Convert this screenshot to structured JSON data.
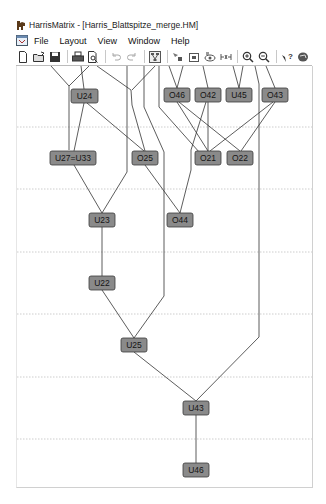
{
  "window": {
    "title": "HarrisMatrix - [Harris_Blattspitze_merge.HM]"
  },
  "menubar": {
    "items": [
      {
        "label": "File"
      },
      {
        "label": "Layout"
      },
      {
        "label": "View"
      },
      {
        "label": "Window"
      },
      {
        "label": "Help"
      }
    ]
  },
  "toolbar": {
    "buttons": [
      {
        "icon": "new-document-icon"
      },
      {
        "icon": "open-folder-icon"
      },
      {
        "icon": "save-icon"
      },
      {
        "icon": "print-icon"
      },
      {
        "icon": "print-preview-icon"
      },
      {
        "icon": "undo-icon",
        "disabled": true
      },
      {
        "icon": "redo-icon",
        "disabled": true
      },
      {
        "icon": "layout-icon"
      },
      {
        "icon": "select-node-icon"
      },
      {
        "icon": "node-properties-icon"
      },
      {
        "icon": "view-icon"
      },
      {
        "icon": "merge-icon"
      },
      {
        "icon": "zoom-in-icon"
      },
      {
        "icon": "zoom-out-icon"
      },
      {
        "icon": "help-icon"
      },
      {
        "icon": "about-icon"
      }
    ]
  },
  "matrix": {
    "node_fill": "#8a8a8a",
    "node_border": "#3a3a3a",
    "edge_color": "#333333",
    "nodes": [
      {
        "id": "U24",
        "label": "U24",
        "x": 67,
        "y": 96,
        "w": 28
      },
      {
        "id": "O46",
        "label": "O46",
        "x": 176,
        "y": 95,
        "w": 26
      },
      {
        "id": "O42",
        "label": "O42",
        "x": 207,
        "y": 95,
        "w": 26
      },
      {
        "id": "U45",
        "label": "U45",
        "x": 238,
        "y": 95,
        "w": 26
      },
      {
        "id": "O43",
        "label": "O43",
        "x": 274,
        "y": 95,
        "w": 26
      },
      {
        "id": "U27=U33",
        "label": "U27=U33",
        "x": 72,
        "y": 158,
        "w": 46
      },
      {
        "id": "O25",
        "label": "O25",
        "x": 144,
        "y": 158,
        "w": 26
      },
      {
        "id": "O21",
        "label": "O21",
        "x": 207,
        "y": 158,
        "w": 26
      },
      {
        "id": "O22",
        "label": "O22",
        "x": 239,
        "y": 158,
        "w": 26
      },
      {
        "id": "U23",
        "label": "U23",
        "x": 101,
        "y": 220,
        "w": 26
      },
      {
        "id": "O44",
        "label": "O44",
        "x": 179,
        "y": 220,
        "w": 26
      },
      {
        "id": "U22",
        "label": "U22",
        "x": 101,
        "y": 283,
        "w": 26
      },
      {
        "id": "U25",
        "label": "U25",
        "x": 133,
        "y": 345,
        "w": 26
      },
      {
        "id": "U43",
        "label": "U43",
        "x": 195,
        "y": 408,
        "w": 26
      },
      {
        "id": "U46",
        "label": "U46",
        "x": 195,
        "y": 470,
        "w": 26
      }
    ],
    "gridlines_y": [
      127,
      189,
      252,
      314,
      377,
      439
    ]
  }
}
